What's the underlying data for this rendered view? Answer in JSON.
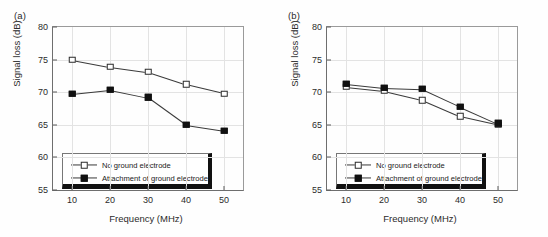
{
  "chart_data": [
    {
      "type": "line",
      "panel_label": "(a)",
      "title": "",
      "xlabel": "Frequency (MHz)",
      "ylabel": "Signal loss (dB)",
      "x": [
        10,
        20,
        30,
        40,
        50
      ],
      "xticklabels": [
        "10",
        "20",
        "30",
        "40",
        "50"
      ],
      "yticklabels": [
        "55",
        "60",
        "65",
        "70",
        "75",
        "80"
      ],
      "xlim": [
        5,
        55
      ],
      "ylim": [
        55,
        80
      ],
      "grid": true,
      "legend_position": "lower left",
      "series": [
        {
          "name": "No ground electrode",
          "marker": "open-square",
          "values": [
            75.0,
            73.9,
            73.1,
            71.2,
            69.8
          ]
        },
        {
          "name": "Attachment of ground electrode",
          "marker": "filled-square",
          "values": [
            69.8,
            70.4,
            69.2,
            65.0,
            64.1
          ]
        }
      ]
    },
    {
      "type": "line",
      "panel_label": "(b)",
      "title": "",
      "xlabel": "Frequency (MHz)",
      "ylabel": "Signal loss (dB)",
      "x": [
        10,
        20,
        30,
        40,
        50
      ],
      "xticklabels": [
        "10",
        "20",
        "30",
        "40",
        "50"
      ],
      "yticklabels": [
        "55",
        "60",
        "65",
        "70",
        "75",
        "80"
      ],
      "xlim": [
        5,
        55
      ],
      "ylim": [
        55,
        80
      ],
      "grid": true,
      "legend_position": "lower left",
      "series": [
        {
          "name": "No ground electrode",
          "marker": "open-square",
          "values": [
            70.8,
            70.2,
            68.8,
            66.3,
            65.0
          ]
        },
        {
          "name": "Attachment of ground electrode",
          "marker": "filled-square",
          "values": [
            71.3,
            70.7,
            70.5,
            67.8,
            65.2
          ]
        }
      ]
    }
  ],
  "colors": {
    "series_line": "#3a3a3a",
    "marker_filled": "#111111",
    "marker_open_fill": "#ffffff",
    "grid": "#e3e3e3",
    "axis": "#6e6e6e",
    "background": "#fefefe"
  }
}
